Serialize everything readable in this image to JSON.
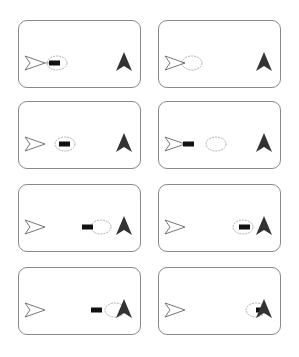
{
  "figure": {
    "colors": {
      "panel_border": "#8a8a8a",
      "bar": "#111111",
      "filled_arrow": "#333333",
      "outline_arrow": "#777777",
      "ellipse": "#9a9a9a"
    },
    "panels": [
      {
        "id": 1,
        "ellipse_x": 38,
        "bar_x": 30,
        "bar_attached_to_arrow": true
      },
      {
        "id": 2,
        "ellipse_x": 33,
        "bar_x": null,
        "bar_attached_to_arrow": false
      },
      {
        "id": 3,
        "ellipse_x": 46,
        "bar_x": 40,
        "bar_attached_to_arrow": false
      },
      {
        "id": 4,
        "ellipse_x": 57,
        "bar_x": 24,
        "bar_attached_to_arrow": true
      },
      {
        "id": 5,
        "ellipse_x": 82,
        "bar_x": 63,
        "bar_attached_to_arrow": false
      },
      {
        "id": 6,
        "ellipse_x": 84,
        "bar_x": 80,
        "bar_attached_to_arrow": false
      },
      {
        "id": 7,
        "ellipse_x": 96,
        "bar_x": 72,
        "bar_attached_to_arrow": false
      },
      {
        "id": 8,
        "ellipse_x": 97,
        "bar_x": 97,
        "bar_attached_to_arrow": false
      }
    ]
  }
}
